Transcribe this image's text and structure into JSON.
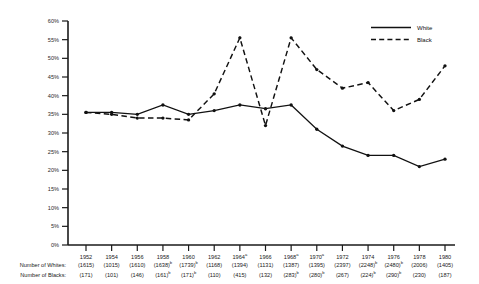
{
  "chart_data": {
    "type": "line",
    "title": "",
    "xlabel": "",
    "ylabel": "",
    "ylim": [
      0,
      60
    ],
    "grid": false,
    "legend_position": "top-right",
    "categories": [
      "1952",
      "1954",
      "1956",
      "1958",
      "1960",
      "1962",
      "1964",
      "1966",
      "1968",
      "1970",
      "1972",
      "1974",
      "1976",
      "1978",
      "1980"
    ],
    "category_superscripts": [
      "",
      "",
      "",
      "",
      "",
      "",
      "a",
      "",
      "a",
      "a",
      "",
      "",
      "",
      "",
      ""
    ],
    "ytick_labels": [
      "0%",
      "5%",
      "10%",
      "15%",
      "20%",
      "25%",
      "30%",
      "35%",
      "40%",
      "45%",
      "50%",
      "55%",
      "60%"
    ],
    "ytick_values": [
      0,
      5,
      10,
      15,
      20,
      25,
      30,
      35,
      40,
      45,
      50,
      55,
      60
    ],
    "series": [
      {
        "name": "White",
        "style": "solid",
        "values": [
          35.5,
          35.5,
          35.0,
          37.5,
          35.0,
          36.0,
          37.5,
          36.5,
          37.5,
          31.0,
          26.5,
          24.0,
          24.0,
          21.0,
          23.0
        ]
      },
      {
        "name": "Black",
        "style": "dashed",
        "values": [
          35.5,
          35.0,
          34.0,
          34.0,
          33.5,
          40.5,
          55.5,
          32.0,
          55.5,
          47.0,
          42.0,
          43.5,
          36.0,
          39.0,
          48.0
        ]
      }
    ],
    "row_labels": [
      "Number of Whites:",
      "Number of Blacks:"
    ],
    "counts_whites": [
      "(1615)",
      "(1015)",
      "(1610)",
      "(1638)",
      "(1739)",
      "(1168)",
      "(1394)",
      "(1131)",
      "(1387)",
      "(1395)",
      "(2397)",
      "(2248)",
      "(2480)",
      "(2006)",
      "(1405)"
    ],
    "counts_whites_sup": [
      "",
      "",
      "",
      "b",
      "b",
      "",
      "",
      "",
      "",
      "",
      "",
      "b",
      "b",
      "",
      ""
    ],
    "counts_blacks": [
      "(171)",
      "(101)",
      "(146)",
      "(161)",
      "(171)",
      "(110)",
      "(415)",
      "(132)",
      "(283)",
      "(280)",
      "(267)",
      "(224)",
      "(290)",
      "(230)",
      "(187)"
    ],
    "counts_blacks_sup": [
      "",
      "",
      "",
      "b",
      "b",
      "",
      "",
      "",
      "b",
      "b",
      "",
      "b",
      "b",
      "",
      ""
    ]
  },
  "legend": {
    "items": [
      {
        "label": "White"
      },
      {
        "label": "Black"
      }
    ]
  },
  "colors": {
    "line": "#111111",
    "axis": "#1a1a1a",
    "background": "#ffffff"
  }
}
